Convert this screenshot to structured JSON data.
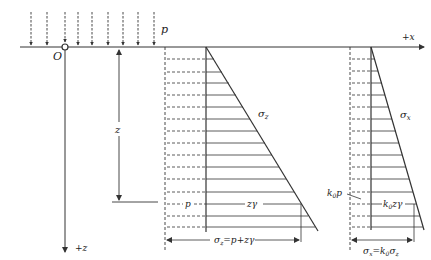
{
  "labels": {
    "load": "p",
    "x_axis": "+x",
    "z_axis": "+z",
    "origin": "O",
    "depth": "z",
    "sigma_z": "σz",
    "sigma_x": "σx",
    "p_part": "p",
    "zgamma_part": "zγ",
    "k0p": "k0p",
    "k0zgamma": "k0zγ",
    "sigma_z_formula": "σz=p+zγ",
    "sigma_x_formula": "σx=k0σz"
  },
  "colors": {
    "line": "#333333",
    "text": "#222222",
    "background": "#ffffff"
  },
  "load_arrows_x": [
    31,
    47,
    65,
    78,
    92,
    108,
    123,
    138,
    154
  ],
  "surface_y": 47,
  "left_diagram": {
    "dashed_x": 165,
    "axis_x": 206,
    "apex_y": 47,
    "bottom_x": 318,
    "bottom_y": 231,
    "hatch_y": [
      59,
      72,
      83,
      95,
      107,
      119,
      131,
      143,
      155,
      167,
      179,
      192,
      204,
      216,
      227
    ],
    "z_level_y": 202
  },
  "right_diagram": {
    "dashed_x": 350,
    "axis_x": 371,
    "apex_y": 47,
    "bottom_x": 424,
    "bottom_y": 230,
    "hatch_y": [
      59,
      71,
      83,
      95,
      107,
      119,
      131,
      143,
      155,
      167,
      179,
      192,
      204,
      216,
      227
    ]
  }
}
